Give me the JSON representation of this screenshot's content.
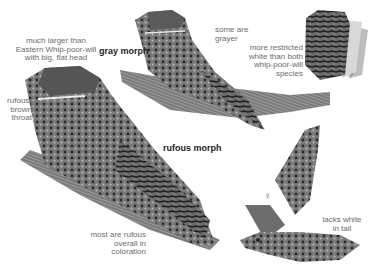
{
  "figure": {
    "labels": {
      "head_note": "much larger than\nEastern Whip-poor-will\nwith big, flat head",
      "throat_note": "rufous-\nbrown\nthroat",
      "gray_morph": "gray morph",
      "gray_note": "some are\ngrayer",
      "tail_note": "more restricted\nwhite than both\nwhip-poor-will\nspecies",
      "rufous_morph": "rufous morph",
      "rufous_note": "most are rufous\noverall in coloration",
      "female_tail_note": "lacks white\nin tail"
    },
    "symbols": {
      "male": "♂",
      "female": "♀"
    }
  }
}
